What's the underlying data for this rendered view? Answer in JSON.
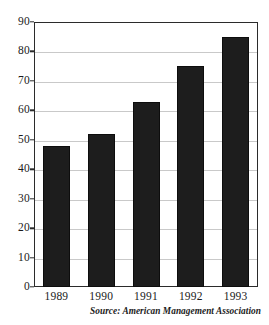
{
  "chart_data": {
    "type": "bar",
    "title": "",
    "subtitle": "",
    "xlabel": "",
    "ylabel": "",
    "categories": [
      "1989",
      "1990",
      "1991",
      "1992",
      "1993"
    ],
    "values": [
      48,
      52,
      63,
      75,
      85
    ],
    "series": [
      {
        "name": "",
        "values": [
          48,
          52,
          63,
          75,
          85
        ]
      }
    ],
    "ylim": [
      0,
      90
    ],
    "y_ticks": [
      0,
      10,
      20,
      30,
      40,
      50,
      60,
      70,
      80,
      90
    ],
    "y_tick_labels": [
      "0",
      "10",
      "20",
      "30",
      "40",
      "50",
      "60",
      "70",
      "80",
      "90"
    ],
    "grid": true,
    "grid_axis": "y",
    "legend": false,
    "legend_position": "none",
    "bar_color": "#1d1d1d",
    "grid_color": "#c9c9c9",
    "axis_color": "#2b2b2b",
    "background_color": "#ffffff",
    "annotations": [
      {
        "name": "source-note",
        "text": "Source: American Management Association",
        "position": "bottom-right"
      }
    ]
  },
  "figure": {
    "source_note": "Source: American Management Association"
  }
}
